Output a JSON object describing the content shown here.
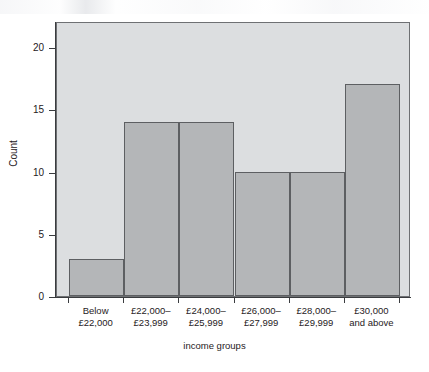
{
  "chart_data": {
    "type": "bar",
    "title": "",
    "subtitle": "",
    "xlabel": "income groups",
    "ylabel": "Count",
    "categories": [
      "Below\n£22,000",
      "£22,000–\n£23,999",
      "£24,000–\n£25,999",
      "£26,000–\n£27,999",
      "£28,000–\n£29,999",
      "£30,000\nand above"
    ],
    "values": [
      3,
      14,
      14,
      10,
      10,
      17
    ],
    "ylim": [
      0,
      22.1
    ],
    "xlim": [
      0,
      6
    ],
    "y_ticks": [
      0,
      5,
      10,
      15,
      20
    ],
    "y_tick_labels": [
      "0",
      "5",
      "10",
      "15",
      "20"
    ],
    "grid": false,
    "legend": false,
    "legend_position": "none",
    "bar_style": "contiguous-histogram",
    "colors": {
      "plot_background": "#dcdee0",
      "bar_fill": "#b4b6b8",
      "bar_edge": "#5d5f62",
      "axis": "#3a3c3f",
      "text": "#1f2123",
      "figure_background": "#ffffff"
    }
  },
  "axes": {
    "y_title": "Count",
    "x_title": "income groups"
  }
}
